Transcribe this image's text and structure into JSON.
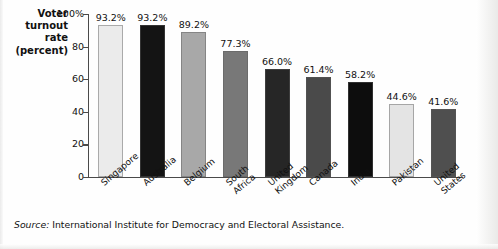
{
  "chart_data": {
    "type": "bar",
    "title": "",
    "ylabel": "Voter turnout rate (percent)",
    "ylabel_lines": [
      "Voter",
      "turnout",
      "rate",
      "(percent)"
    ],
    "xlabel": "",
    "ylim": [
      0,
      100
    ],
    "grid": false,
    "legend": "none",
    "yticks": [
      {
        "value": 100,
        "label": "100%"
      },
      {
        "value": 80,
        "label": "80"
      },
      {
        "value": 60,
        "label": "60"
      },
      {
        "value": 40,
        "label": "40"
      },
      {
        "value": 20,
        "label": "20"
      },
      {
        "value": 0,
        "label": "0"
      }
    ],
    "categories": [
      "Singapore",
      "Australia",
      "Belgium",
      "South Africa",
      "United Kingdom",
      "Canada",
      "India",
      "Pakistan",
      "United States"
    ],
    "category_lines": [
      [
        "Singapore"
      ],
      [
        "Australia"
      ],
      [
        "Belgium"
      ],
      [
        "South",
        "Africa"
      ],
      [
        "United",
        "Kingdom"
      ],
      [
        "Canada"
      ],
      [
        "India"
      ],
      [
        "Pakistan"
      ],
      [
        "United",
        "States"
      ]
    ],
    "values": [
      93.2,
      93.2,
      89.2,
      77.3,
      66.0,
      61.4,
      58.2,
      44.6,
      41.6
    ],
    "value_labels": [
      "93.2%",
      "93.2%",
      "89.2%",
      "77.3%",
      "66.0%",
      "61.4%",
      "58.2%",
      "44.6%",
      "41.6%"
    ],
    "bar_colors": [
      "#ebebeb",
      "#141414",
      "#a8a8a8",
      "#787878",
      "#262626",
      "#4a4a4a",
      "#0d0d0d",
      "#e4e4e4",
      "#4f4f4f"
    ],
    "axis_color": "#4a4a4a",
    "text_color": "#111111"
  },
  "source": {
    "prefix": "Source:",
    "text": " International Institute for Democracy and Electoral Assistance."
  }
}
